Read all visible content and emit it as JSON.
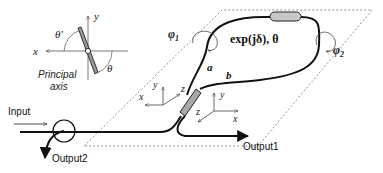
{
  "diagram": {
    "inset": {
      "x_label": "x",
      "y_label": "y",
      "theta_prime_label": "θ'",
      "theta_label": "θ",
      "principal_axis_line1": "Principal",
      "principal_axis_line2": "axis"
    },
    "loop": {
      "phi1_label": "φ",
      "phi1_sub": "1",
      "phi2_label": "φ",
      "phi2_sub": "2",
      "element_label": "exp(jδ), θ",
      "arm_a_label": "a",
      "arm_b_label": "b"
    },
    "coupler_axes": {
      "left": {
        "x": "x",
        "y": "y",
        "z": "z"
      },
      "right": {
        "x": "x",
        "y": "y",
        "z": "z"
      }
    },
    "ports": {
      "input_label": "Input",
      "output1_label": "Output1",
      "output2_label": "Output2"
    },
    "colors": {
      "line": "#111111",
      "dashed": "#777777",
      "coupler_fill": "#a8a8a8",
      "element_fill": "#c8c8c8"
    }
  }
}
